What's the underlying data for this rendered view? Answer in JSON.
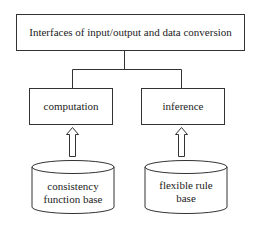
{
  "diagram": {
    "top_box": {
      "label": "Interfaces of input/output and data conversion"
    },
    "modules": [
      {
        "label": "computation"
      },
      {
        "label": "inference"
      }
    ],
    "databases": [
      {
        "line1": "consistency",
        "line2": "function base"
      },
      {
        "line1": "flexible rule",
        "line2": "base"
      }
    ],
    "colors": {
      "stroke": "#333333",
      "background": "#ffffff"
    }
  }
}
